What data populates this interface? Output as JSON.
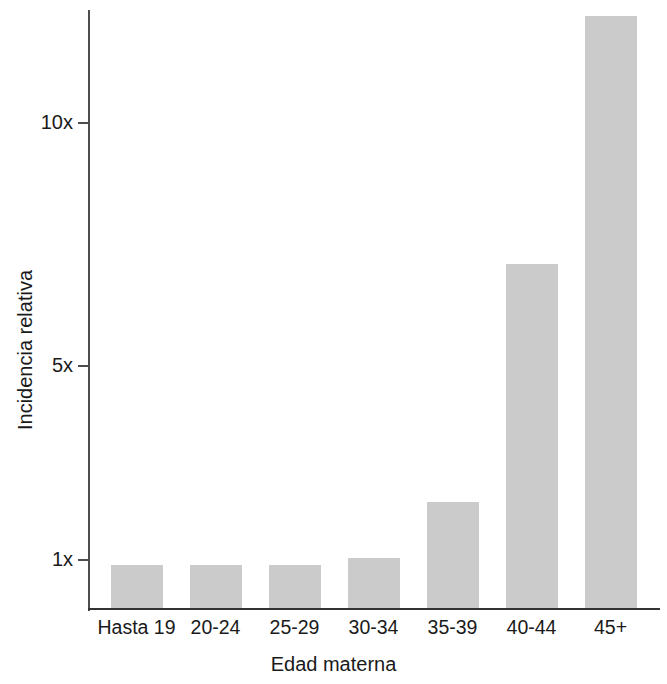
{
  "chart_data": {
    "type": "bar",
    "title": "",
    "subtitle": "",
    "xlabel": "Edad materna",
    "ylabel": "Incidencia relativa",
    "categories": [
      "Hasta 19",
      "20-24",
      "25-29",
      "30-34",
      "35-39",
      "40-44",
      "45+"
    ],
    "values": [
      0.9,
      0.9,
      0.9,
      1.05,
      2.2,
      7.1,
      12.2
    ],
    "ytick_labels": [
      "1x",
      "5x",
      "10x"
    ],
    "ytick_values": [
      1,
      5,
      10
    ],
    "ylim": [
      0,
      12.9
    ],
    "grid": false,
    "legend": null,
    "bar_color": "#cbcbcb",
    "axis_color": "#333333",
    "text_color": "#1a1a1a",
    "annotations": []
  },
  "axes": {
    "y_title": "Incidencia relativa",
    "x_title": "Edad materna",
    "y_ticks": [
      {
        "label": "10x",
        "value": 10
      },
      {
        "label": "5x",
        "value": 5
      },
      {
        "label": "1x",
        "value": 1
      }
    ]
  },
  "bars": [
    {
      "label": "Hasta 19",
      "value": 0.9
    },
    {
      "label": "20-24",
      "value": 0.9
    },
    {
      "label": "25-29",
      "value": 0.9
    },
    {
      "label": "30-34",
      "value": 1.05
    },
    {
      "label": "35-39",
      "value": 2.2
    },
    {
      "label": "40-44",
      "value": 7.1
    },
    {
      "label": "45+",
      "value": 12.2
    }
  ]
}
